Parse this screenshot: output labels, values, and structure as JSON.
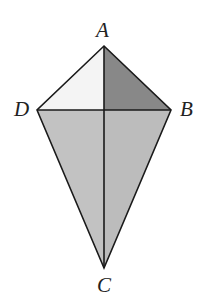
{
  "figure": {
    "name": "kite-abcd",
    "shape_type": "kite",
    "background_color": "#ffffff",
    "stroke_color": "#1a1a1a",
    "stroke_width": 1.6,
    "canvas": {
      "width": 202,
      "height": 306
    },
    "vertices": [
      {
        "id": "A",
        "label": "A",
        "x": 104,
        "y": 46,
        "position": "top"
      },
      {
        "id": "B",
        "label": "B",
        "x": 171,
        "y": 110,
        "position": "right"
      },
      {
        "id": "C",
        "label": "C",
        "x": 104,
        "y": 268,
        "position": "bottom"
      },
      {
        "id": "D",
        "label": "D",
        "x": 37,
        "y": 110,
        "position": "left"
      }
    ],
    "center": {
      "id": "E",
      "x": 104,
      "y": 110,
      "label": ""
    },
    "diagonals": [
      {
        "id": "AC",
        "from": "A",
        "to": "C",
        "orientation": "vertical"
      },
      {
        "id": "DB",
        "from": "D",
        "to": "B",
        "orientation": "horizontal"
      }
    ],
    "outline_points": "104,46 171,110 104,268 37,110",
    "regions": [
      {
        "id": "ADE",
        "name": "upper-left-triangle",
        "points": "104,46 37,110 104,110",
        "fill": "#f4f4f4"
      },
      {
        "id": "ABE",
        "name": "upper-right-triangle",
        "points": "104,46 171,110 104,110",
        "fill": "#888888"
      },
      {
        "id": "DCE",
        "name": "lower-left-triangle",
        "points": "37,110 104,268 104,110",
        "fill": "#c2c2c2"
      },
      {
        "id": "BCE",
        "name": "lower-right-triangle",
        "points": "171,110 104,268 104,110",
        "fill": "#bcbcbc"
      }
    ]
  }
}
